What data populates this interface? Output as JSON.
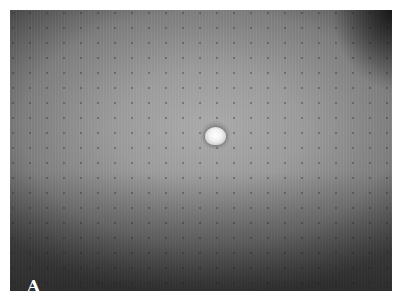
{
  "figure": {
    "panel_label": "A",
    "colors": {
      "background": "#ffffff",
      "skin_tone": "#9a9a9a",
      "lesion": "#f2f2f2",
      "label": "#ffffff"
    }
  }
}
